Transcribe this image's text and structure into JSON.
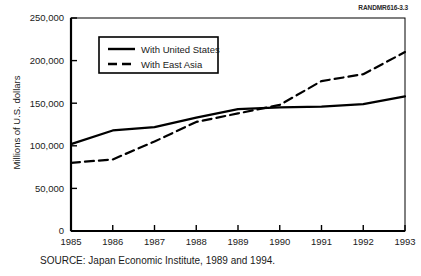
{
  "figure_id": "RANDMR616-3.3",
  "source_note": "SOURCE:  Japan Economic Institute, 1989 and 1994.",
  "chart_data": {
    "type": "line",
    "title": "",
    "xlabel": "",
    "ylabel": "Millions of U.S. dollars",
    "x": [
      1985,
      1986,
      1987,
      1988,
      1989,
      1990,
      1991,
      1992,
      1993
    ],
    "xticklabels": [
      "1985",
      "1986",
      "1987",
      "1988",
      "1989",
      "1990",
      "1991",
      "1992",
      "1993"
    ],
    "xlim": [
      1985,
      1993
    ],
    "ylim": [
      0,
      250000
    ],
    "yticks": [
      0,
      50000,
      100000,
      150000,
      200000,
      250000
    ],
    "yticklabels": [
      "0",
      "50,000",
      "100,000",
      "150,000",
      "200,000",
      "250,000"
    ],
    "grid": false,
    "legend_position": "upper-left-inside",
    "series": [
      {
        "name": "With United States",
        "style": "solid",
        "color": "#000000",
        "values": [
          102000,
          118000,
          122000,
          133000,
          143000,
          145000,
          146000,
          149000,
          158000
        ]
      },
      {
        "name": "With East Asia",
        "style": "dashed",
        "color": "#000000",
        "values": [
          80000,
          84000,
          105000,
          128000,
          138000,
          148000,
          176000,
          184000,
          210000
        ]
      }
    ]
  }
}
